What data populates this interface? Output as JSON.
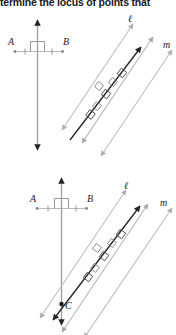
{
  "prompt": {
    "text": "termine the locus of points that"
  },
  "colors": {
    "ink": "#1c1c1c",
    "dark_line": "#232323",
    "gray_line": "#b9b9b9",
    "mid_gray_line": "#a8a8a8",
    "point_fill": "#7a7a7a",
    "tick": "#8c8c8c"
  },
  "figures": [
    {
      "id": "figure-1",
      "segment": {
        "label_a": "A",
        "label_b": "B",
        "tick_marks": 2,
        "right_angle_mark": true
      },
      "perpendicular_bisector": {
        "arrow_top": true,
        "arrow_bottom": true
      },
      "parallel_lines": {
        "label_l": "ℓ",
        "label_m": "m",
        "midline_present": true,
        "right_angle_marks": 3
      },
      "transversal": {
        "arrow_top": true,
        "arrow_bottom": true
      },
      "point_c": null
    },
    {
      "id": "figure-2",
      "segment": {
        "label_a": "A",
        "label_b": "B",
        "tick_marks": 2,
        "right_angle_mark": true
      },
      "perpendicular_bisector": {
        "arrow_top": true,
        "arrow_bottom": true
      },
      "parallel_lines": {
        "label_l": "ℓ",
        "label_m": "m",
        "midline_present": true,
        "right_angle_marks": 3
      },
      "transversal": {
        "arrow_top": true,
        "arrow_bottom": true
      },
      "point_c": {
        "label": "C"
      }
    }
  ]
}
